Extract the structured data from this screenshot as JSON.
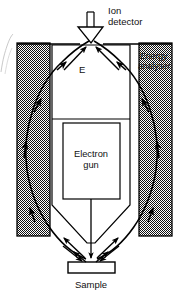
{
  "figure": {
    "type": "instrument-schematic",
    "background_color": "#ffffff",
    "line_color": "#000000",
    "stipple_color": "#000000"
  },
  "labels": {
    "detector_line1": "Ion",
    "detector_line2": "detector",
    "analyser_line1": "Energy",
    "analyser_line2": "analyser",
    "gun_line1": "Electron",
    "gun_line2": "gun",
    "sample": "Sample",
    "field": "E"
  },
  "components": {
    "ion_detector": {
      "name": "Ion detector",
      "shape": "stem-and-cone",
      "stem_x": 91,
      "stem_top_y": 12,
      "stem_bottom_y": 26,
      "cone_top_y": 26,
      "cone_tip_y": 41
    },
    "energy_analyser": {
      "name": "Energy analyser",
      "shape": "two-stippled-plates",
      "left_plate": {
        "x": 17,
        "y": 43,
        "width": 33,
        "height": 193
      },
      "right_plate": {
        "x": 139,
        "y": 43,
        "width": 33,
        "height": 193
      },
      "fill": "stipple"
    },
    "electron_gun": {
      "name": "Electron gun",
      "shape": "rectangle",
      "x": 63,
      "y": 123,
      "width": 57,
      "height": 76,
      "fill": "#ffffff"
    },
    "inner_chamber": {
      "name": "Inner chamber",
      "shape": "tapered-polygon",
      "top_y": 45,
      "waist_y": 205,
      "tip_y": 243
    },
    "sample": {
      "name": "Sample",
      "shape": "rectangle",
      "x": 68,
      "y": 262,
      "width": 47,
      "height": 11,
      "fill": "#ffffff"
    }
  },
  "trajectories": {
    "description": "Curved ion paths from sample through analyser field to detector",
    "count": 2,
    "arrowheads_per_path": 3,
    "straight_rays_to_detector": 2,
    "straight_rays_from_sample": 4,
    "beam_axis_x": 91
  }
}
